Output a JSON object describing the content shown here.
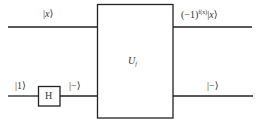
{
  "diagram": {
    "type": "quantum-circuit",
    "oracle": {
      "symbol": "U",
      "subscript": "f"
    },
    "gates": [
      {
        "name": "H",
        "label": "H"
      }
    ],
    "wires": {
      "top": {
        "input_label_pre": "|",
        "input_label_var": "x",
        "input_label_post": "⟩",
        "output_prefix": "(−1)",
        "output_exponent": "f(x)",
        "output_ket_pre": "|",
        "output_ket_var": "x",
        "output_ket_post": "⟩"
      },
      "bottom": {
        "input_label": "|1⟩",
        "after_h_label": "|−⟩",
        "output_label": "|−⟩"
      }
    },
    "colors": {
      "line": "#222222",
      "text": "#333333",
      "background": "#ffffff"
    }
  }
}
